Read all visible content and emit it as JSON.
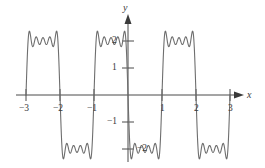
{
  "figure": {
    "background_color": "#ffffff",
    "curve_color": "#6e6e6e",
    "axis_color": "#4a4a4a",
    "label_color": "#3a3a3a",
    "width": 265,
    "height": 168
  },
  "axes": {
    "x_axis_label": "x",
    "y_axis_label": "y",
    "x_ticks": [
      {
        "value": -3,
        "label": "−3"
      },
      {
        "value": -2,
        "label": "−2"
      },
      {
        "value": -1,
        "label": "−1"
      },
      {
        "value": 1,
        "label": "1"
      },
      {
        "value": 2,
        "label": "2"
      },
      {
        "value": 3,
        "label": "3"
      }
    ],
    "y_ticks": [
      {
        "value": 2,
        "label": "2"
      },
      {
        "value": 1,
        "label": "1"
      },
      {
        "value": -1,
        "label": "−1"
      },
      {
        "value": -2,
        "label": "−2"
      }
    ]
  },
  "chart_data": {
    "type": "line",
    "title": "",
    "subtitle": "",
    "xlabel": "x",
    "ylabel": "y",
    "xlim": [
      -3.25,
      3.25
    ],
    "ylim": [
      -2.6,
      2.6
    ],
    "grid": false,
    "legend": null,
    "series": [
      {
        "name": "Fourier partial sum of square wave",
        "color": "#6e6e6e",
        "function": "square_wave_fourier_partial_sum",
        "amplitude": 2,
        "period": 2,
        "harmonics": 9,
        "domain": [
          -3,
          3
        ],
        "ripples_per_plateau": 4,
        "x": [
          -3,
          -2,
          -2,
          -1,
          -1,
          0,
          0,
          1,
          1,
          2,
          2,
          3
        ],
        "y": [
          2,
          2,
          -2,
          -2,
          2,
          2,
          -2,
          -2,
          2,
          2,
          -2,
          -2
        ],
        "plateaus": [
          {
            "x_start": -3,
            "x_end": -2,
            "level": 2
          },
          {
            "x_start": -2,
            "x_end": -1,
            "level": -2
          },
          {
            "x_start": -1,
            "x_end": 0,
            "level": 2
          },
          {
            "x_start": 0,
            "x_end": 1,
            "level": -2
          },
          {
            "x_start": 1,
            "x_end": 2,
            "level": 2
          },
          {
            "x_start": 2,
            "x_end": 3,
            "level": -2
          }
        ]
      }
    ],
    "x_tick_values": [
      -3,
      -2,
      -1,
      1,
      2,
      3
    ],
    "x_tick_labels": [
      "−3",
      "−2",
      "−1",
      "1",
      "2",
      "3"
    ],
    "y_tick_values": [
      2,
      1,
      -1,
      -2
    ],
    "y_tick_labels": [
      "2",
      "1",
      "−1",
      "−2"
    ]
  }
}
